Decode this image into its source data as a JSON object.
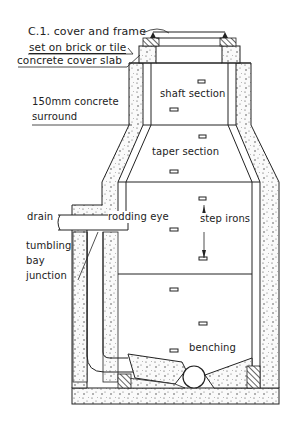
{
  "diagram": {
    "type": "manhole cross-section",
    "labels": {
      "cover": "C.1. cover and frame",
      "bedding": "set on brick or tile",
      "slab": "concrete cover slab",
      "surround_line1": "150mm concrete",
      "surround_line2": "surround",
      "shaft": "shaft section",
      "taper": "taper section",
      "drain": "drain",
      "rodding": "rodding eye",
      "steps": "step irons",
      "tumbling_1": "tumbling",
      "tumbling_2": "bay",
      "tumbling_3": "junction",
      "benching": "benching"
    },
    "colors": {
      "ink": "#222222",
      "background": "#ffffff",
      "concrete": "#f4f4f4"
    }
  }
}
